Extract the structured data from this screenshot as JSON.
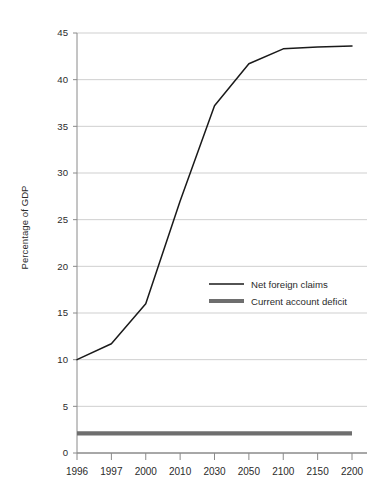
{
  "chart_data": {
    "type": "line",
    "title": "",
    "xlabel": "",
    "ylabel": "Percentage of GDP",
    "x": [
      "1996",
      "1997",
      "2000",
      "2010",
      "2030",
      "2050",
      "2100",
      "2150",
      "2200"
    ],
    "categories": [
      "1996",
      "1997",
      "2000",
      "2010",
      "2030",
      "2050",
      "2100",
      "2150",
      "2200"
    ],
    "series": [
      {
        "name": "Net foreign claims",
        "style": "thin-black-line",
        "color": "#1a1a1a",
        "values": [
          10.0,
          11.7,
          16.0,
          27.0,
          37.2,
          41.7,
          43.3,
          43.5,
          43.6
        ]
      },
      {
        "name": "Current account deficit",
        "style": "thick-gray-line",
        "color": "#6e6e6e",
        "values": [
          2.1,
          2.1,
          2.1,
          2.1,
          2.1,
          2.1,
          2.1,
          2.1,
          2.1
        ]
      }
    ],
    "ylim": [
      0,
      45
    ],
    "yticks": [
      0,
      5,
      10,
      15,
      20,
      25,
      30,
      35,
      40,
      45
    ],
    "ytick_labels": [
      "0",
      "5",
      "10",
      "15",
      "20",
      "25",
      "30",
      "35",
      "40",
      "45"
    ],
    "grid": "horizontal",
    "legend_position": "inside-center-right",
    "legend": [
      "Net foreign claims",
      "Current account deficit"
    ]
  },
  "axes": {
    "y_title": "Percentage of GDP",
    "y_labels": [
      "45",
      "40",
      "35",
      "30",
      "25",
      "20",
      "15",
      "10",
      "5",
      "0"
    ],
    "x_labels": [
      "1996",
      "1997",
      "2000",
      "2010",
      "2030",
      "2050",
      "2100",
      "2150",
      "2200"
    ]
  },
  "legend": {
    "items": [
      {
        "label": "Net foreign claims",
        "swatch": "thin-line-swatch"
      },
      {
        "label": "Current account deficit",
        "swatch": "thick-line-swatch"
      }
    ]
  },
  "colors": {
    "line_primary": "#1a1a1a",
    "line_secondary": "#6e6e6e",
    "grid": "#cfcfcf",
    "axis": "#7a7a7a",
    "text": "#2b2b2b",
    "background": "#ffffff"
  }
}
